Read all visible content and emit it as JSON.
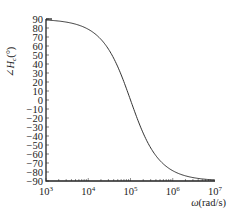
{
  "chart_data": {
    "type": "line",
    "title": "",
    "xlabel": "ω(rad/s)",
    "ylabel": "∠H_c(°)",
    "xscale": "log",
    "xlim": [
      1000,
      10000000
    ],
    "ylim": [
      -90,
      90
    ],
    "grid": false,
    "legend": null,
    "x_tick_labels": [
      "10^3",
      "10^4",
      "10^5",
      "10^6",
      "10^7"
    ],
    "y_tick_labels": [
      "90",
      "80",
      "70",
      "60",
      "50",
      "40",
      "30",
      "20",
      "10",
      "0",
      "-10",
      "-20",
      "-30",
      "-40",
      "-50",
      "-60",
      "-70",
      "-80",
      "-90"
    ],
    "series": [
      {
        "name": "phase",
        "x": [
          1000,
          3162,
          10000,
          31623,
          100000,
          316228,
          1000000,
          3162278,
          10000000
        ],
        "values": [
          88.9,
          86.4,
          78.6,
          55.1,
          0,
          -55.1,
          -78.6,
          -86.4,
          -88.9
        ]
      }
    ],
    "corner_frequency": 100000
  },
  "colors": {
    "axis": "#222222",
    "curve": "#333333",
    "text": "#222222"
  }
}
